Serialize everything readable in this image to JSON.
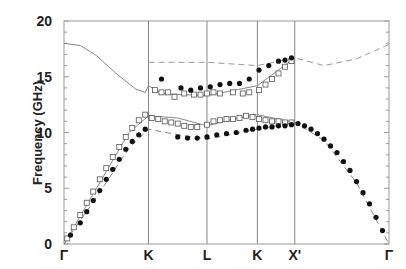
{
  "chart_data": {
    "type": "scatter",
    "title": "",
    "xlabel": "",
    "ylabel": "Frequency (GHz)",
    "ylim": [
      0,
      20
    ],
    "yticks": [
      "0",
      "5",
      "10",
      "15",
      "20"
    ],
    "xticks": [
      {
        "label": "Γ",
        "pos": 0.0
      },
      {
        "label": "K",
        "pos": 0.26
      },
      {
        "label": "L",
        "pos": 0.44
      },
      {
        "label": "K",
        "pos": 0.595
      },
      {
        "label": "X'",
        "pos": 0.71
      },
      {
        "label": "Γ",
        "pos": 1.0
      }
    ],
    "grid": "vertical lines at symmetry points",
    "legend": "none",
    "series": [
      {
        "name": "upper theory (solid)",
        "style": "solid-line",
        "color": "#888888",
        "x": [
          0.0,
          0.05,
          0.1,
          0.16,
          0.22,
          0.25,
          0.26,
          0.3,
          0.44,
          0.595,
          0.71
        ],
        "y": [
          18.0,
          17.8,
          16.9,
          15.3,
          13.9,
          13.6,
          14.2,
          13.5,
          13.3,
          14.2,
          16.7
        ]
      },
      {
        "name": "upper theory (dashed)",
        "style": "dashed-line",
        "color": "#999999",
        "x": [
          0.26,
          0.44,
          0.595,
          0.71,
          0.8,
          0.9,
          1.0
        ],
        "y": [
          16.3,
          16.3,
          16.0,
          16.7,
          16.0,
          16.6,
          17.9
        ]
      },
      {
        "name": "middle theory (solid)",
        "style": "solid-line",
        "color": "#888888",
        "x": [
          0.0,
          0.1,
          0.2,
          0.26,
          0.35,
          0.44,
          0.52,
          0.595,
          0.71
        ],
        "y": [
          0.0,
          5.0,
          10.0,
          11.5,
          11.3,
          10.6,
          11.2,
          11.6,
          10.9
        ]
      },
      {
        "name": "lower theory (dashed/solid)",
        "style": "dashed-line",
        "color": "#888888",
        "x": [
          0.0,
          0.1,
          0.2,
          0.26,
          0.35,
          0.44,
          0.595,
          0.71,
          0.8,
          0.9,
          1.0
        ],
        "y": [
          0.0,
          4.2,
          8.6,
          10.3,
          9.8,
          9.4,
          10.3,
          10.9,
          9.3,
          5.5,
          0.0
        ]
      },
      {
        "name": "open squares (measured)",
        "style": "open-square",
        "color": "#555555",
        "x": [
          0.01,
          0.03,
          0.05,
          0.07,
          0.09,
          0.11,
          0.13,
          0.15,
          0.17,
          0.19,
          0.21,
          0.23,
          0.25,
          0.27,
          0.29,
          0.31,
          0.33,
          0.35,
          0.37,
          0.39,
          0.41,
          0.44,
          0.46,
          0.48,
          0.5,
          0.52,
          0.54,
          0.56,
          0.58,
          0.6,
          0.62,
          0.64,
          0.66,
          0.68,
          0.7,
          0.28,
          0.3,
          0.32,
          0.34,
          0.37,
          0.4,
          0.42,
          0.44,
          0.46,
          0.48,
          0.52,
          0.55,
          0.57,
          0.6,
          0.62,
          0.64,
          0.66,
          0.68,
          0.7
        ],
        "y": [
          0.5,
          1.5,
          2.6,
          3.7,
          4.7,
          5.8,
          6.8,
          7.8,
          8.7,
          9.6,
          10.4,
          11.1,
          11.6,
          11.3,
          11.2,
          11.0,
          10.9,
          10.8,
          10.6,
          10.5,
          10.5,
          10.7,
          11.0,
          11.1,
          11.2,
          11.2,
          11.3,
          11.5,
          11.4,
          11.2,
          11.1,
          11.0,
          11.0,
          10.9,
          10.9,
          13.8,
          13.6,
          13.6,
          13.2,
          13.5,
          13.4,
          13.4,
          13.5,
          13.6,
          13.5,
          13.6,
          13.5,
          13.6,
          13.8,
          14.3,
          14.8,
          15.3,
          15.9,
          16.4
        ]
      },
      {
        "name": "filled circles (measured)",
        "style": "filled-circle",
        "color": "#111111",
        "x": [
          0.02,
          0.05,
          0.07,
          0.09,
          0.11,
          0.13,
          0.15,
          0.17,
          0.19,
          0.21,
          0.23,
          0.25,
          0.35,
          0.38,
          0.41,
          0.44,
          0.47,
          0.5,
          0.53,
          0.56,
          0.58,
          0.6,
          0.62,
          0.64,
          0.66,
          0.68,
          0.7,
          0.72,
          0.74,
          0.76,
          0.78,
          0.8,
          0.82,
          0.84,
          0.86,
          0.88,
          0.9,
          0.92,
          0.94,
          0.96,
          0.98,
          0.3,
          0.36,
          0.39,
          0.42,
          0.45,
          0.48,
          0.51,
          0.54,
          0.57,
          0.6,
          0.63,
          0.66,
          0.68,
          0.7
        ],
        "y": [
          0.8,
          1.9,
          2.9,
          3.9,
          4.8,
          5.8,
          6.7,
          7.6,
          8.5,
          9.2,
          9.8,
          10.3,
          9.6,
          9.5,
          9.5,
          9.6,
          9.8,
          9.9,
          10.0,
          10.2,
          10.3,
          10.4,
          10.5,
          10.5,
          10.6,
          10.6,
          10.7,
          10.8,
          10.6,
          10.3,
          9.9,
          9.4,
          8.8,
          8.2,
          7.4,
          6.6,
          5.6,
          4.6,
          3.6,
          2.4,
          1.2,
          14.8,
          14.0,
          13.8,
          14.0,
          14.1,
          14.3,
          14.4,
          14.4,
          14.8,
          15.6,
          16.0,
          16.4,
          16.5,
          16.7
        ]
      }
    ]
  },
  "axis": {
    "y_title": "Frequency (GHz)",
    "y_ticks": [
      {
        "label": "20",
        "v": 20
      },
      {
        "label": "15",
        "v": 15
      },
      {
        "label": "10",
        "v": 10
      },
      {
        "label": "5",
        "v": 5
      },
      {
        "label": "0",
        "v": 0
      }
    ],
    "x_labels": [
      "Γ",
      "K",
      "L",
      "K",
      "X'",
      "Γ"
    ]
  }
}
